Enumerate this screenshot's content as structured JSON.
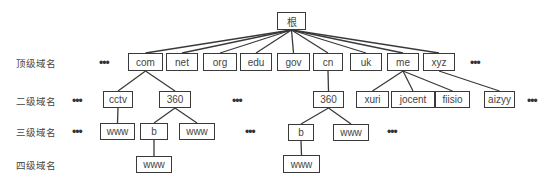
{
  "diagram": {
    "level_labels": [
      {
        "id": "top",
        "text": "顶级域名",
        "x": 16,
        "y": 56
      },
      {
        "id": "second",
        "text": "二级域名",
        "x": 16,
        "y": 94
      },
      {
        "id": "third",
        "text": "三级域名",
        "x": 16,
        "y": 125
      },
      {
        "id": "fourth",
        "text": "四级域名",
        "x": 16,
        "y": 158
      }
    ],
    "ellipsis_glyph": "•••",
    "ellipses": [
      {
        "id": "top-left",
        "x": 99,
        "y": 58
      },
      {
        "id": "top-right",
        "x": 470,
        "y": 58
      },
      {
        "id": "second-left",
        "x": 72,
        "y": 96
      },
      {
        "id": "second-mid",
        "x": 232,
        "y": 96
      },
      {
        "id": "second-right",
        "x": 527,
        "y": 96
      },
      {
        "id": "third-left",
        "x": 72,
        "y": 127
      },
      {
        "id": "third-mid",
        "x": 245,
        "y": 127
      },
      {
        "id": "third-right",
        "x": 387,
        "y": 127
      }
    ],
    "nodes": [
      {
        "id": "root",
        "label": "根",
        "x": 277,
        "y": 12,
        "w": 29,
        "h": 18
      },
      {
        "id": "com",
        "label": "com",
        "x": 128,
        "y": 53,
        "w": 35,
        "h": 18
      },
      {
        "id": "net",
        "label": "net",
        "x": 166,
        "y": 53,
        "w": 32,
        "h": 18
      },
      {
        "id": "org",
        "label": "org",
        "x": 203,
        "y": 53,
        "w": 34,
        "h": 18
      },
      {
        "id": "edu",
        "label": "edu",
        "x": 240,
        "y": 53,
        "w": 32,
        "h": 18
      },
      {
        "id": "gov",
        "label": "gov",
        "x": 277,
        "y": 53,
        "w": 33,
        "h": 18
      },
      {
        "id": "cn",
        "label": "cn",
        "x": 313,
        "y": 53,
        "w": 30,
        "h": 18
      },
      {
        "id": "uk",
        "label": "uk",
        "x": 350,
        "y": 53,
        "w": 32,
        "h": 18
      },
      {
        "id": "me",
        "label": "me",
        "x": 387,
        "y": 53,
        "w": 32,
        "h": 18
      },
      {
        "id": "xyz",
        "label": "xyz",
        "x": 423,
        "y": 53,
        "w": 32,
        "h": 18
      },
      {
        "id": "cctv",
        "label": "cctv",
        "x": 103,
        "y": 91,
        "w": 30,
        "h": 17
      },
      {
        "id": "com-360",
        "label": "360",
        "x": 159,
        "y": 91,
        "w": 32,
        "h": 17
      },
      {
        "id": "cn-360",
        "label": "360",
        "x": 313,
        "y": 91,
        "w": 31,
        "h": 17
      },
      {
        "id": "xuri",
        "label": "xuri",
        "x": 356,
        "y": 91,
        "w": 33,
        "h": 17
      },
      {
        "id": "jocent",
        "label": "jocent",
        "x": 391,
        "y": 91,
        "w": 44,
        "h": 17
      },
      {
        "id": "fiisio",
        "label": "fiisio",
        "x": 435,
        "y": 91,
        "w": 35,
        "h": 17
      },
      {
        "id": "aizyy",
        "label": "aizyy",
        "x": 484,
        "y": 91,
        "w": 31,
        "h": 17
      },
      {
        "id": "cctv-www",
        "label": "www",
        "x": 100,
        "y": 123,
        "w": 35,
        "h": 17
      },
      {
        "id": "com360-b",
        "label": "b",
        "x": 140,
        "y": 123,
        "w": 28,
        "h": 17
      },
      {
        "id": "com360-www",
        "label": "www",
        "x": 179,
        "y": 123,
        "w": 36,
        "h": 17
      },
      {
        "id": "cn360-b",
        "label": "b",
        "x": 288,
        "y": 124,
        "w": 26,
        "h": 17
      },
      {
        "id": "cn360-www",
        "label": "www",
        "x": 333,
        "y": 124,
        "w": 36,
        "h": 17
      },
      {
        "id": "com-b-www",
        "label": "www",
        "x": 136,
        "y": 156,
        "w": 36,
        "h": 17
      },
      {
        "id": "cn-b-www",
        "label": "www",
        "x": 283,
        "y": 155,
        "w": 37,
        "h": 18
      }
    ],
    "edges": [
      [
        "root",
        "com"
      ],
      [
        "root",
        "net"
      ],
      [
        "root",
        "org"
      ],
      [
        "root",
        "edu"
      ],
      [
        "root",
        "gov"
      ],
      [
        "root",
        "cn"
      ],
      [
        "root",
        "uk"
      ],
      [
        "root",
        "me"
      ],
      [
        "root",
        "xyz"
      ],
      [
        "com",
        "cctv"
      ],
      [
        "com",
        "com-360"
      ],
      [
        "cn",
        "cn-360"
      ],
      [
        "me",
        "xuri"
      ],
      [
        "me",
        "jocent"
      ],
      [
        "me",
        "fiisio"
      ],
      [
        "xyz",
        "aizyy"
      ],
      [
        "cctv",
        "cctv-www"
      ],
      [
        "com-360",
        "com360-b"
      ],
      [
        "com-360",
        "com360-www"
      ],
      [
        "cn-360",
        "cn360-b"
      ],
      [
        "cn-360",
        "cn360-www"
      ],
      [
        "com360-b",
        "com-b-www"
      ],
      [
        "cn360-b",
        "cn-b-www"
      ]
    ]
  }
}
